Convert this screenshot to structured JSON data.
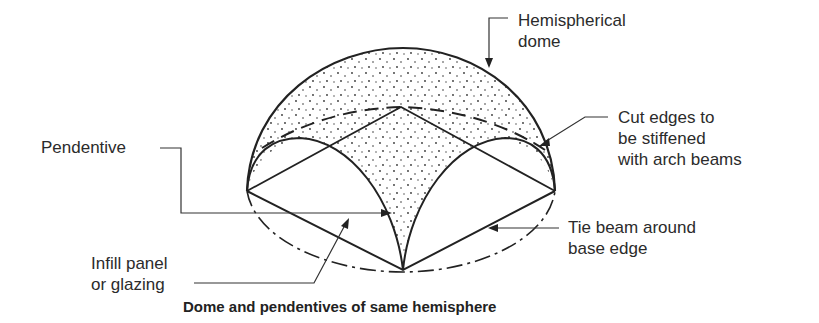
{
  "figure": {
    "caption": "Dome and pendentives of same hemisphere",
    "labels": {
      "hemispherical_dome": [
        "Hemispherical",
        "dome"
      ],
      "pendentive": "Pendentive",
      "cut_edges": [
        "Cut edges to",
        "be stiffened",
        "with arch beams"
      ],
      "infill_panel": [
        "Infill panel",
        "or glazing"
      ],
      "tie_beam": [
        "Tie beam around",
        "base edge"
      ]
    }
  }
}
